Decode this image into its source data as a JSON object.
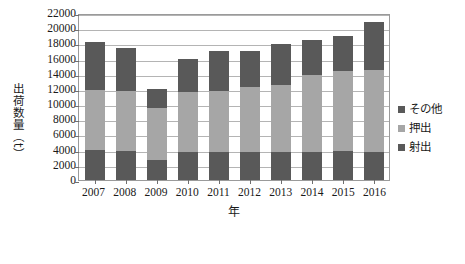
{
  "chart_data": {
    "type": "bar",
    "stacked": true,
    "title": "",
    "xlabel": "年",
    "ylabel": "出荷数量（t）",
    "ylabel_chars": [
      "出",
      "荷",
      "数",
      "量",
      "（",
      "t",
      "）"
    ],
    "categories": [
      "2007",
      "2008",
      "2009",
      "2010",
      "2011",
      "2012",
      "2013",
      "2014",
      "2015",
      "2016"
    ],
    "ylim": [
      0,
      22000
    ],
    "ytick_step": 2000,
    "yticks": [
      "22000",
      "20000",
      "18000",
      "16000",
      "14000",
      "12000",
      "10000",
      "8000",
      "6000",
      "4000",
      "2000",
      "0"
    ],
    "grid": true,
    "grid_axis": "y",
    "legend_position": "right",
    "series": [
      {
        "name": "射出",
        "color": "#595959",
        "values": [
          3900,
          3850,
          2600,
          3700,
          3650,
          3700,
          3650,
          3750,
          3800,
          3700
        ]
      },
      {
        "name": "押出",
        "color": "#a6a6a6",
        "values": [
          7900,
          7850,
          6900,
          7850,
          8100,
          8500,
          8900,
          10050,
          10600,
          10800
        ]
      },
      {
        "name": "その他",
        "color": "#595959",
        "values": [
          6400,
          5700,
          2500,
          4450,
          5250,
          4800,
          5350,
          4700,
          4600,
          6300
        ]
      }
    ],
    "totals": [
      18200,
      17400,
      12000,
      16000,
      17000,
      17000,
      17900,
      18500,
      19000,
      20800
    ],
    "stack_order_bottom_to_top": [
      "射出",
      "押出",
      "その他"
    ],
    "colors": {
      "shanetsu": "#595959",
      "oshidashi": "#a6a6a6",
      "sonota": "#595959",
      "gridline": "#b4b4b4",
      "axis": "#9a9a9a",
      "text": "#1a1a1a"
    }
  },
  "legend": {
    "items": [
      {
        "label": "その他",
        "color": "#595959"
      },
      {
        "label": "押出",
        "color": "#a6a6a6"
      },
      {
        "label": "射出",
        "color": "#595959"
      }
    ]
  }
}
